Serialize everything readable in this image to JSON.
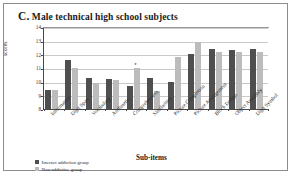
{
  "figure": {
    "panel_letter": "C.",
    "title_rest": " Male technical high school subjects",
    "full_title": "C. Male technical high school subjects"
  },
  "axes": {
    "ylabel": "scores",
    "xlabel": "Sub-items",
    "yticks": [
      "14",
      "13",
      "12",
      "11",
      "10",
      "9",
      "8"
    ]
  },
  "legend": {
    "items": [
      {
        "label": "Internet addiction group",
        "color": "#4f4f4f"
      },
      {
        "label": "Non-addictive group",
        "color": "#bcbcbc"
      }
    ]
  },
  "annotations": {
    "significance_marker": "*"
  },
  "chart_data": {
    "type": "bar",
    "title": "C. Male technical high school subjects",
    "xlabel": "Sub-items",
    "ylabel": "scores",
    "ylim": [
      8,
      14
    ],
    "yticks": [
      8,
      9,
      10,
      11,
      12,
      13,
      14
    ],
    "grid": true,
    "legend_position": "bottom-left",
    "categories": [
      "Information",
      "Digit Span",
      "Vocabulary",
      "Arithmetic",
      "Comprehension",
      "Similarities",
      "Picture Completion",
      "Picture Arrangement",
      "Block Design",
      "Object Assembly",
      "Digit Symbol"
    ],
    "series": [
      {
        "name": "Internet addiction group",
        "color": "#4f4f4f",
        "values": [
          9.4,
          11.6,
          10.3,
          10.2,
          9.7,
          10.3,
          10.0,
          12.0,
          12.4,
          12.3,
          12.4
        ]
      },
      {
        "name": "Non-addictive group",
        "color": "#bcbcbc",
        "values": [
          9.4,
          11.0,
          9.9,
          10.1,
          11.0,
          9.3,
          11.8,
          12.9,
          12.2,
          12.2,
          12.2
        ]
      }
    ],
    "annotations": [
      {
        "text": "*",
        "category": "Comprehension",
        "series": "Non-addictive group",
        "y": 11.0
      }
    ]
  }
}
